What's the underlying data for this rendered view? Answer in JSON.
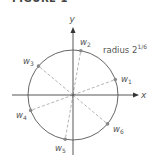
{
  "figure": {
    "title": "FIGURE 1",
    "axes": {
      "x_label": "x",
      "y_label": "y"
    },
    "circle_label": {
      "text": "radius 2",
      "superscript": "1/6"
    },
    "points": [
      {
        "name": "w",
        "sub": "1",
        "angle_deg": 20
      },
      {
        "name": "w",
        "sub": "2",
        "angle_deg": 80
      },
      {
        "name": "w",
        "sub": "3",
        "angle_deg": 140
      },
      {
        "name": "w",
        "sub": "4",
        "angle_deg": 200
      },
      {
        "name": "w",
        "sub": "5",
        "angle_deg": 260
      },
      {
        "name": "w",
        "sub": "6",
        "angle_deg": 320
      }
    ],
    "colors": {
      "axis": "#444444",
      "circle": "#555555",
      "rays": "#aaaaaa",
      "points": "#888888"
    }
  }
}
